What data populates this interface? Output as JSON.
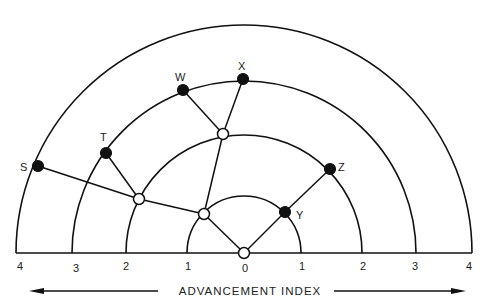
{
  "diagram": {
    "type": "radial-network",
    "center": {
      "x": 244,
      "y": 253
    },
    "baseline": {
      "x1": 16,
      "x2": 472,
      "y": 253
    },
    "rings": [
      {
        "index": 1,
        "radius": 57
      },
      {
        "index": 2,
        "radius": 118
      },
      {
        "index": 3,
        "radius": 172
      },
      {
        "index": 4,
        "radius": 228
      }
    ],
    "tick_labels": [
      {
        "text": "4",
        "x": 20,
        "y": 270
      },
      {
        "text": "3",
        "x": 76,
        "y": 272
      },
      {
        "text": "2",
        "x": 126,
        "y": 270
      },
      {
        "text": "1",
        "x": 188,
        "y": 270
      },
      {
        "text": "0",
        "x": 245,
        "y": 272
      },
      {
        "text": "1",
        "x": 302,
        "y": 270
      },
      {
        "text": "2",
        "x": 363,
        "y": 270
      },
      {
        "text": "3",
        "x": 415,
        "y": 270
      },
      {
        "text": "4",
        "x": 469,
        "y": 270
      }
    ],
    "axis_title": "ADVANCEMENT INDEX",
    "nodes": [
      {
        "id": "origin",
        "label": "",
        "type": "open",
        "x": 244,
        "y": 253
      },
      {
        "id": "a",
        "label": "",
        "type": "open",
        "x": 204,
        "y": 214
      },
      {
        "id": "b",
        "label": "",
        "type": "open",
        "x": 139,
        "y": 199
      },
      {
        "id": "c",
        "label": "",
        "type": "open",
        "x": 223,
        "y": 134
      },
      {
        "id": "Y",
        "label": "Y",
        "type": "filled",
        "x": 285,
        "y": 212,
        "lx": 296,
        "ly": 219
      },
      {
        "id": "Z",
        "label": "Z",
        "type": "filled",
        "x": 330,
        "y": 169,
        "lx": 338,
        "ly": 171
      },
      {
        "id": "T",
        "label": "T",
        "type": "filled",
        "x": 106,
        "y": 153,
        "lx": 100,
        "ly": 141
      },
      {
        "id": "W",
        "label": "W",
        "type": "filled",
        "x": 183,
        "y": 90,
        "lx": 175,
        "ly": 81
      },
      {
        "id": "X",
        "label": "X",
        "type": "filled",
        "x": 243,
        "y": 79,
        "lx": 238,
        "ly": 70
      },
      {
        "id": "S",
        "label": "S",
        "type": "filled",
        "x": 38,
        "y": 166,
        "lx": 20,
        "ly": 171
      }
    ],
    "edges": [
      [
        "origin",
        "a"
      ],
      [
        "origin",
        "Y"
      ],
      [
        "Y",
        "Z"
      ],
      [
        "a",
        "b"
      ],
      [
        "a",
        "c"
      ],
      [
        "b",
        "S"
      ],
      [
        "b",
        "T"
      ],
      [
        "c",
        "W"
      ],
      [
        "c",
        "X"
      ]
    ]
  }
}
